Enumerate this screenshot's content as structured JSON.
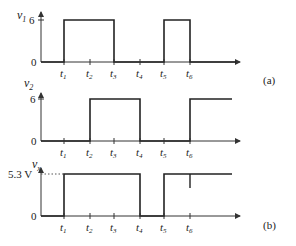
{
  "figure": {
    "panel_a_label": "(a)",
    "panel_b_label": "(b)",
    "time_ticks": [
      "t1",
      "t2",
      "t3",
      "t4",
      "t5",
      "t6"
    ],
    "plots": [
      {
        "id": "v1",
        "ylabel": "v",
        "ylabel_sub": "1",
        "high_label": "6",
        "zero_label": "0",
        "high_intervals": [
          [
            "t1",
            "t3"
          ],
          [
            "t5",
            "t6"
          ]
        ]
      },
      {
        "id": "v2",
        "ylabel": "v",
        "ylabel_sub": "2",
        "high_label": "6",
        "zero_label": "0",
        "high_intervals": [
          [
            "t2",
            "t4"
          ],
          [
            "t6",
            "end"
          ]
        ]
      },
      {
        "id": "vx",
        "ylabel": "v",
        "ylabel_sub": "x",
        "high_label": "5.3 V",
        "zero_label": "0",
        "high_intervals": [
          [
            "t1",
            "t4"
          ],
          [
            "t5",
            "end"
          ]
        ],
        "glitch_at": "t6"
      }
    ],
    "tick_labels": {
      "t": "t",
      "subs": [
        "1",
        "2",
        "3",
        "4",
        "5",
        "6"
      ]
    }
  },
  "colors": {
    "line": "#222222",
    "axis": "#333333",
    "dotted": "#555555",
    "background": "#ffffff"
  }
}
